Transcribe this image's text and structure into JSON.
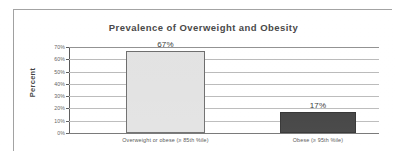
{
  "chart_data": {
    "type": "bar",
    "title": "Prevalence of Overweight and Obesity",
    "xlabel": "",
    "ylabel": "Percent",
    "categories": [
      "Overweight or obese (≥ 85th %ile)",
      "Obese (≥ 95th %ile)"
    ],
    "values": [
      67,
      17
    ],
    "value_labels": [
      "67%",
      "17%"
    ],
    "ylim": [
      0,
      70
    ],
    "ytick_values": [
      0,
      10,
      20,
      30,
      40,
      50,
      60,
      70
    ],
    "ytick_labels": [
      "0%",
      "10%",
      "20%",
      "30%",
      "40%",
      "50%",
      "60%",
      "70%"
    ],
    "grid": true,
    "legend": false,
    "bar_colors": [
      "#e2e2e2",
      "#3c3c3c"
    ],
    "bar_border_colors": [
      "#6a6a6a",
      "#2b2b2b"
    ]
  },
  "axis": {
    "y_title": "Percent"
  },
  "colors": {
    "frame": "#9a9a9a",
    "gridline": "#b9b9b9",
    "axis": "#555555",
    "title_text": "#3b3b3b",
    "tick_text": "#585858",
    "background": "#ffffff"
  }
}
